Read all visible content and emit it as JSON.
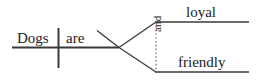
{
  "diagram": {
    "type": "sentence-diagram",
    "sentence": "Dogs are loyal and friendly.",
    "style": {
      "line_color": "#3a3a3a",
      "text_color": "#1c1c1c",
      "background_color": "#ffffff",
      "dotted_line_color": "#6b6b6b"
    },
    "subject": {
      "label": "Dogs",
      "role": "subject"
    },
    "verb": {
      "label": "are",
      "role": "linking-verb"
    },
    "conjunction": {
      "label": "and",
      "role": "coordinating-conjunction",
      "orientation": "vertical-rotated"
    },
    "complements": [
      {
        "label": "loyal",
        "role": "predicate-adjective",
        "branch": "upper"
      },
      {
        "label": "friendly",
        "role": "predicate-adjective",
        "branch": "lower"
      }
    ]
  }
}
